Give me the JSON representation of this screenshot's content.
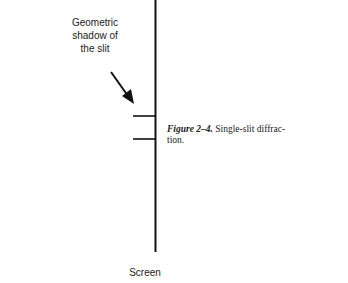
{
  "figure": {
    "annotation": {
      "line1": "Geometric",
      "line2": "shadow of",
      "line3": "the slit"
    },
    "screen_label": "Screen",
    "caption": {
      "figure_number": "Figure 2–4.",
      "text": "Single-slit diffrac-",
      "text_cont": "tion."
    }
  }
}
